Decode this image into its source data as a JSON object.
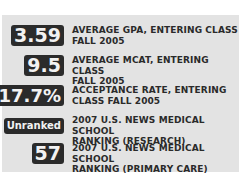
{
  "stats": [
    {
      "value": "3.59",
      "label_line1": "AVERAGE GPA, ENTERING CLASS",
      "label_line2": "FALL 2005"
    },
    {
      "value": "9.5",
      "label_line1": "AVERAGE MCAT, ENTERING CLASS",
      "label_line2": "FALL 2005"
    },
    {
      "value": "17.7%",
      "label_line1": "ACCEPTANCE RATE, ENTERING",
      "label_line2": "CLASS FALL 2005"
    },
    {
      "value": "Unranked",
      "label_line1": "2007 U.S. NEWS MEDICAL SCHOOL",
      "label_line2": "RANKING (RESEARCH)"
    },
    {
      "value": "57",
      "label_line1": "2007 U.S. NEWS MEDICAL SCHOOL",
      "label_line2": "RANKING (PRIMARY CARE)"
    }
  ],
  "colors": {
    "panel_bg": "#e3e3e3",
    "badge_bg": "#2b2b2b",
    "badge_text": "#f2f2f2",
    "label_text": "#2a2a2a"
  }
}
